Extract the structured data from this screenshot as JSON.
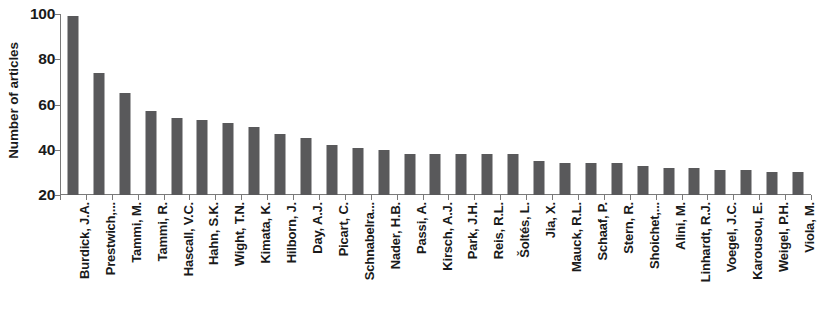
{
  "chart_data": {
    "type": "bar",
    "title": "",
    "xlabel": "",
    "ylabel": "Number of articles",
    "ylim": [
      20,
      100
    ],
    "yticks": [
      20,
      40,
      60,
      80,
      100
    ],
    "ytick_labels": [
      "20",
      "40",
      "60",
      "80",
      "100"
    ],
    "grid": false,
    "legend": "none",
    "orientation": "vertical",
    "bar_color": "#59595B",
    "axis_color": "#7A7A7A",
    "categories": [
      "Burdick, J.A.",
      "Prestwich,...",
      "Tammi, M.",
      "Tammi, R.",
      "Hascall, V.C.",
      "Hahn, S.K.",
      "Wight, T.N.",
      "Kimata, K.",
      "Hilborn, J.",
      "Day, A.J.",
      "Picart, C.",
      "Schnabelra...",
      "Nader, H.B.",
      "Passi, A.",
      "Kirsch, A.J.",
      "Park, J.H.",
      "Reis, R.L.",
      "Šoltés, L.",
      "Jia, X.",
      "Mauck, R.L.",
      "Schaaf, P.",
      "Stern, R.",
      "Shoichet,...",
      "Alini, M.",
      "Linhardt, R.J.",
      "Voegel, J.C.",
      "Karousou, E.",
      "Weigel, P.H.",
      "Viola, M."
    ],
    "values": [
      99,
      74,
      65,
      57,
      54,
      53,
      52,
      50,
      47,
      45,
      42,
      41,
      40,
      38,
      38,
      38,
      38,
      38,
      35,
      34,
      34,
      34,
      33,
      32,
      32,
      31,
      31,
      30,
      30
    ]
  }
}
